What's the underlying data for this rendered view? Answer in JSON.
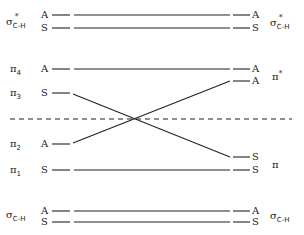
{
  "diagram": {
    "type": "orbital-correlation-diagram",
    "left_levels": [
      {
        "id": "sigma_star_A",
        "mo": "σ*C-H",
        "symmetry": "A",
        "y": 15
      },
      {
        "id": "sigma_star_S",
        "mo": "σ*C-H",
        "symmetry": "S",
        "y": 28
      },
      {
        "id": "pi4",
        "mo": "π4",
        "symmetry": "A",
        "y": 69
      },
      {
        "id": "pi3",
        "mo": "π3",
        "symmetry": "S",
        "y": 93
      },
      {
        "id": "pi2",
        "mo": "π2",
        "symmetry": "A",
        "y": 144
      },
      {
        "id": "pi1",
        "mo": "π1",
        "symmetry": "S",
        "y": 170
      },
      {
        "id": "sigma_A",
        "mo": "σC-H",
        "symmetry": "A",
        "y": 211
      },
      {
        "id": "sigma_S",
        "mo": "σC-H",
        "symmetry": "S",
        "y": 222
      }
    ],
    "right_levels": [
      {
        "id": "r_sigma_star_A",
        "symmetry": "A",
        "y": 15
      },
      {
        "id": "r_sigma_star_S",
        "symmetry": "S",
        "y": 28
      },
      {
        "id": "r_pistar_A1",
        "symmetry": "A",
        "y": 69
      },
      {
        "id": "r_pistar_A2",
        "symmetry": "A",
        "y": 81
      },
      {
        "id": "r_pi_S1",
        "symmetry": "S",
        "y": 157
      },
      {
        "id": "r_pi_S2",
        "symmetry": "S",
        "y": 170
      },
      {
        "id": "r_sigma_A",
        "symmetry": "A",
        "y": 211
      },
      {
        "id": "r_sigma_S",
        "symmetry": "S",
        "y": 222
      }
    ],
    "correlations": [
      {
        "from": "sigma_star_A",
        "to": "r_sigma_star_A"
      },
      {
        "from": "sigma_star_S",
        "to": "r_sigma_star_S"
      },
      {
        "from": "pi4",
        "to": "r_pistar_A1"
      },
      {
        "from": "pi3",
        "to": "r_pi_S1"
      },
      {
        "from": "pi2",
        "to": "r_pistar_A2"
      },
      {
        "from": "pi1",
        "to": "r_pi_S2"
      },
      {
        "from": "sigma_A",
        "to": "r_sigma_A"
      },
      {
        "from": "sigma_S",
        "to": "r_sigma_S"
      }
    ],
    "dashed_line_y": 119,
    "left_labels": {
      "sigma_star": {
        "base": "σ",
        "sup": "*",
        "sub": "C-H"
      },
      "pi4": {
        "base": "π",
        "sub": "4"
      },
      "pi3": {
        "base": "π",
        "sub": "3"
      },
      "pi2": {
        "base": "π",
        "sub": "2"
      },
      "pi1": {
        "base": "π",
        "sub": "1"
      },
      "sigma": {
        "base": "σ",
        "sub": "C-H"
      }
    },
    "right_labels": {
      "sigma_star": {
        "base": "σ",
        "sup": "*",
        "sub": "C-H"
      },
      "pi_star": {
        "base": "π",
        "sup": "*"
      },
      "pi": {
        "base": "π"
      },
      "sigma": {
        "base": "σ",
        "sub": "C-H"
      }
    },
    "symmetry_labels": {
      "A": "A",
      "S": "S"
    }
  }
}
